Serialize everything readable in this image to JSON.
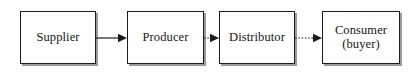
{
  "diagram": {
    "background_color": "#ffffff",
    "stroke_color": "#1c1c1c",
    "shadow_color": "#9a9a9a",
    "text_color": "#161616",
    "nodes": [
      {
        "id": "supplier",
        "label": "Supplier",
        "x": 20,
        "y": 11,
        "width": 76,
        "height": 53
      },
      {
        "id": "producer",
        "label": "Producer",
        "x": 127,
        "y": 11,
        "width": 77,
        "height": 53
      },
      {
        "id": "distributor",
        "label": "Distributor",
        "x": 219,
        "y": 11,
        "width": 76,
        "height": 53
      },
      {
        "id": "consumer",
        "label": "Consumer\n(buyer)",
        "x": 322,
        "y": 11,
        "width": 78,
        "height": 53
      }
    ],
    "connectors": [
      {
        "id": "supplier-to-producer",
        "from": "supplier",
        "to": "producer",
        "style": "solid",
        "x": 96,
        "y": 32,
        "width": 31
      },
      {
        "id": "producer-to-distributor",
        "from": "producer",
        "to": "distributor",
        "style": "dotted",
        "x": 204,
        "y": 32,
        "width": 15
      },
      {
        "id": "distributor-to-consumer",
        "from": "distributor",
        "to": "consumer",
        "style": "dotted",
        "x": 295,
        "y": 32,
        "width": 27
      }
    ]
  }
}
